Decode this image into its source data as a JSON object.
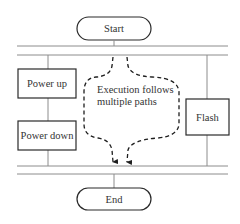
{
  "diagram": {
    "type": "flowchart",
    "start_label": "Start",
    "end_label": "End",
    "nodes": [
      {
        "id": "power-up",
        "label": "Power up"
      },
      {
        "id": "power-down",
        "label": "Power down"
      },
      {
        "id": "flash",
        "label": "Flash"
      }
    ],
    "annotation": {
      "line1": "Execution follows",
      "line2": "multiple paths"
    },
    "colors": {
      "line": "#8c8c8c",
      "box_stroke": "#2a2a2a",
      "text": "#333333",
      "dash": "#1e1e1e"
    }
  }
}
